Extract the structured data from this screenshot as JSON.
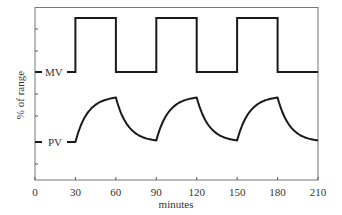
{
  "chart_data": {
    "type": "line",
    "title": "",
    "xlabel": "minutes",
    "ylabel": "% of range",
    "xlim": [
      0,
      210
    ],
    "x_ticks": [
      0,
      30,
      60,
      90,
      120,
      150,
      180,
      210
    ],
    "x_tick_labels": [
      "0",
      "30",
      "60",
      "90",
      "120",
      "150",
      "180",
      "210"
    ],
    "y_ticks_unlabeled": true,
    "grid": false,
    "legend": "inline labels at left axis",
    "series": [
      {
        "name": "MV",
        "label": "MV",
        "shape": "square wave",
        "x": [
          0,
          30,
          30,
          60,
          60,
          90,
          90,
          120,
          120,
          150,
          150,
          180,
          180,
          210
        ],
        "level": [
          "low",
          "low",
          "high",
          "high",
          "low",
          "low",
          "high",
          "high",
          "low",
          "low",
          "high",
          "high",
          "low",
          "low"
        ]
      },
      {
        "name": "PV",
        "label": "PV",
        "shape": "first-order response to MV",
        "x": [
          0,
          30,
          60,
          90,
          120,
          150,
          180,
          210
        ],
        "level": [
          "base",
          "base",
          "peak",
          "base",
          "peak",
          "base",
          "peak",
          "base"
        ]
      }
    ]
  },
  "axis": {
    "xlabel": "minutes",
    "ylabel": "% of range",
    "ticks": [
      "0",
      "30",
      "60",
      "90",
      "120",
      "150",
      "180",
      "210"
    ]
  },
  "labels": {
    "mv": "MV",
    "pv": "PV"
  },
  "colors": {
    "line": "#1a1a1a",
    "axis": "#555555",
    "text": "#333333"
  }
}
